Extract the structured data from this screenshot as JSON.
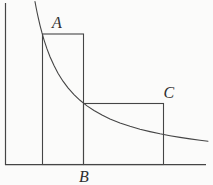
{
  "figure": {
    "labels": {
      "a": "A",
      "b": "B",
      "c": "C"
    },
    "colors": {
      "line": "#454545",
      "label": "#2f2f2f",
      "background": "#fbfbfa"
    }
  }
}
